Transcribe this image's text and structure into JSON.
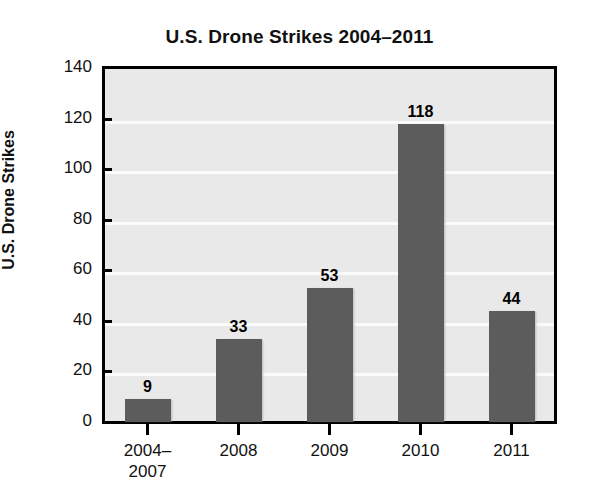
{
  "chart_data": {
    "type": "bar",
    "title": "U.S. Drone Strikes 2004–2011",
    "xlabel": "",
    "ylabel": "U.S. Drone Strikes",
    "categories": [
      "2004–\n2007",
      "2008",
      "2009",
      "2010",
      "2011"
    ],
    "values": [
      9,
      33,
      53,
      118,
      44
    ],
    "value_labels": [
      "9",
      "33",
      "53",
      "118",
      "44"
    ],
    "ylim": [
      0,
      140
    ],
    "yticks": [
      0,
      20,
      40,
      60,
      80,
      100,
      120,
      140
    ],
    "ytick_labels": [
      "0",
      "20",
      "40",
      "60",
      "80",
      "100",
      "120",
      "140"
    ],
    "grid": true,
    "grid_axis": "y",
    "legend": false,
    "legend_position": "none",
    "bar_color": "#5c5c5c",
    "plot_background": "#e9e9e9",
    "gridline_color": "#fbfbfb",
    "axis_color": "#000000",
    "text_color": "#111111"
  }
}
